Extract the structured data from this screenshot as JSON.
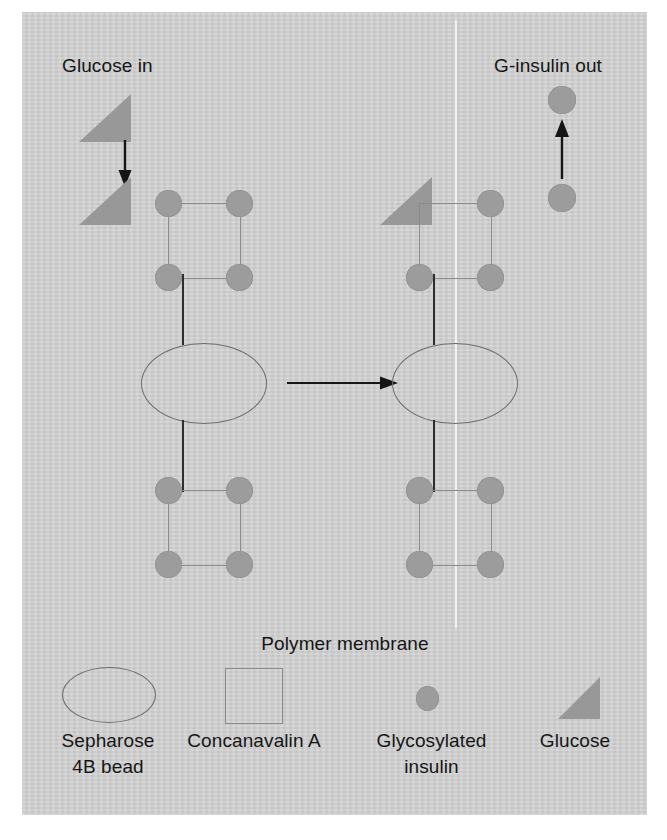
{
  "figure": {
    "kind": "diagram"
  },
  "labels": {
    "glucose_in": "Glucose in",
    "g_insulin_out": "G-insulin out",
    "polymer_membrane": "Polymer membrane"
  },
  "legend": {
    "items": [
      {
        "shape": "ellipse",
        "label_line1": "Sepharose",
        "label_line2": "4B bead"
      },
      {
        "shape": "square",
        "label_line1": "Concanavalin A",
        "label_line2": ""
      },
      {
        "shape": "circle",
        "label_line1": "Glycosylated",
        "label_line2": "insulin"
      },
      {
        "shape": "triangle",
        "label_line1": "Glucose",
        "label_line2": ""
      }
    ]
  },
  "panels": {
    "left": {
      "name": "bound state",
      "bound_insulin_count": 8,
      "free_insulin_count": 0,
      "glucose_present": true
    },
    "right": {
      "name": "displaced state",
      "bound_insulin_count": 7,
      "free_insulin_count": 2,
      "glucose_bound": true
    }
  },
  "arrows": {
    "glucose_in": "down",
    "reaction": "right",
    "g_insulin_out": "up"
  },
  "colors": {
    "panel_background": "#d3d3d3",
    "shape_fill": "#9c9c9c",
    "triangle_fill": "#989898",
    "outline": "#8b8b8b",
    "link": "#2e2e2e",
    "text": "#151515",
    "membrane": "#f2f2f2"
  }
}
